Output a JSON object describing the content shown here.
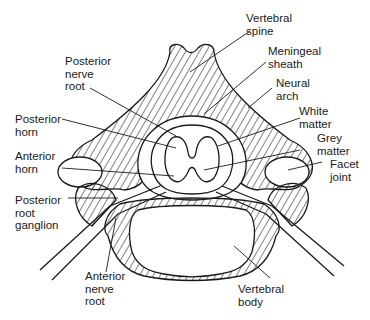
{
  "diagram": {
    "labels": {
      "vertebral_spine": "Vertebral\nspine",
      "meningeal_sheath": "Meningeal\nsheath",
      "neural_arch": "Neural\narch",
      "white_matter": "White\nmatter",
      "grey_matter": "Grey\nmatter",
      "facet_joint": "Facet\njoint",
      "posterior_nerve_root": "Posterior\nnerve\nroot",
      "posterior_horn": "Posterior\nhorn",
      "anterior_horn": "Anterior\nhorn",
      "posterior_root_ganglion": "Posterior\nroot\nganglion",
      "anterior_nerve_root": "Anterior\nnerve\nroot",
      "vertebral_body": "Vertebral\nbody"
    },
    "caption": "",
    "colors": {
      "line": "#1a1a1a",
      "background": "#ffffff"
    }
  }
}
